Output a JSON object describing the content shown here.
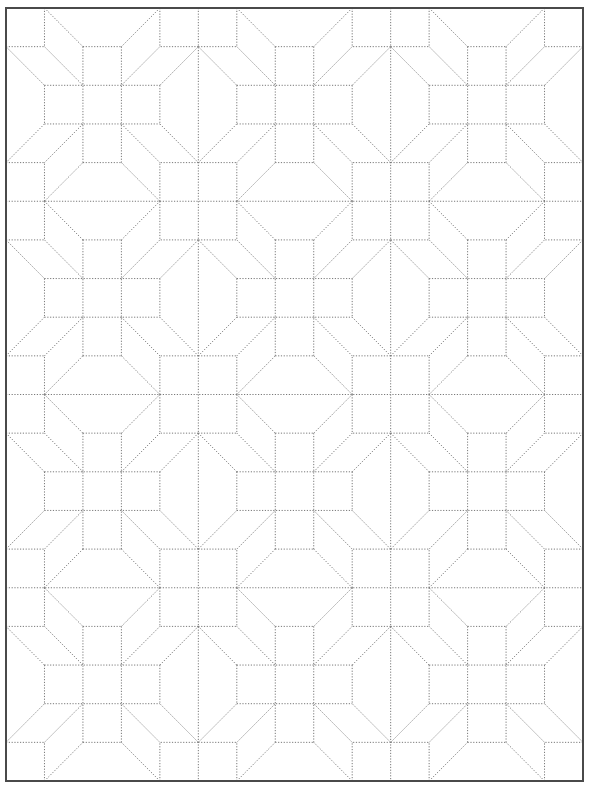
{
  "pattern": {
    "name": "star-block-quilt-pattern",
    "frame": {
      "x": 6,
      "y": 8,
      "width": 577,
      "height": 773
    },
    "grid": {
      "cols": 15,
      "rows": 20
    },
    "blocks": {
      "across": 3,
      "down": 4,
      "size_cells": 5
    },
    "colors": {
      "background": "#ffffff",
      "border": "#4a4a4a",
      "line": "#7a7a7a"
    },
    "star_template_segments": [
      [
        2,
        1,
        2,
        4
      ],
      [
        3,
        1,
        3,
        4
      ],
      [
        1,
        2,
        4,
        2
      ],
      [
        1,
        3,
        4,
        3
      ],
      [
        2,
        1,
        3,
        1
      ],
      [
        2,
        4,
        3,
        4
      ],
      [
        1,
        2,
        1,
        3
      ],
      [
        4,
        2,
        4,
        3
      ],
      [
        1,
        0,
        1,
        1
      ],
      [
        0,
        1,
        1,
        1
      ],
      [
        1,
        0,
        2,
        1
      ],
      [
        1,
        1,
        2,
        2
      ],
      [
        0,
        1,
        1,
        2
      ],
      [
        4,
        0,
        4,
        1
      ],
      [
        5,
        1,
        4,
        1
      ],
      [
        4,
        0,
        3,
        1
      ],
      [
        4,
        1,
        3,
        2
      ],
      [
        5,
        1,
        4,
        2
      ],
      [
        1,
        5,
        1,
        4
      ],
      [
        0,
        4,
        1,
        4
      ],
      [
        1,
        5,
        2,
        4
      ],
      [
        1,
        4,
        2,
        3
      ],
      [
        0,
        4,
        1,
        3
      ],
      [
        4,
        5,
        4,
        4
      ],
      [
        5,
        4,
        4,
        4
      ],
      [
        4,
        5,
        3,
        4
      ],
      [
        4,
        4,
        3,
        3
      ],
      [
        5,
        4,
        4,
        3
      ]
    ],
    "block_boundary_lines": {
      "vertical_cells": [
        5,
        10
      ],
      "horizontal_cells": [
        5,
        10,
        15
      ]
    }
  }
}
